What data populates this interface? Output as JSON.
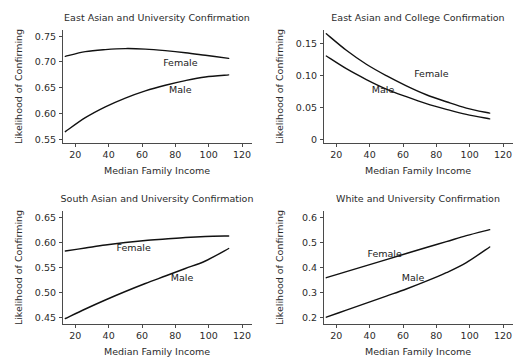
{
  "figure": {
    "width": 521,
    "height": 363,
    "background": "#ffffff",
    "line_color": "#111111",
    "axis_color": "#4a4a4a",
    "text_color": "#2b2b2b",
    "panel_layout": "2x2-grid"
  },
  "chart_data": [
    {
      "id": "east-asian-university",
      "position": "top-left",
      "type": "line",
      "title": "East Asian and University Confirmation",
      "xlabel": "Median Family Income",
      "ylabel": "Likelihood of Confirming",
      "xlim": [
        12,
        126
      ],
      "ylim": [
        0.543,
        0.762
      ],
      "xticks": [
        20,
        40,
        60,
        80,
        100,
        120
      ],
      "xticklabels": [
        "20",
        "40",
        "60",
        "80",
        "100",
        "120"
      ],
      "yticks": [
        0.55,
        0.6,
        0.65,
        0.7,
        0.75
      ],
      "yticklabels": [
        "0.55",
        "0.60",
        "0.65",
        "0.70",
        "0.75"
      ],
      "grid": false,
      "legend": "inline-labels",
      "x": [
        14,
        26,
        38,
        50,
        62,
        74,
        86,
        98,
        112
      ],
      "series": [
        {
          "name": "Female",
          "label": "Female",
          "label_x": 83,
          "label_y": 0.693,
          "values": [
            0.711,
            0.72,
            0.724,
            0.726,
            0.725,
            0.722,
            0.718,
            0.713,
            0.707
          ]
        },
        {
          "name": "Male",
          "label": "Male",
          "label_x": 83,
          "label_y": 0.639,
          "values": [
            0.565,
            0.592,
            0.613,
            0.63,
            0.644,
            0.655,
            0.664,
            0.671,
            0.675
          ]
        }
      ]
    },
    {
      "id": "east-asian-college",
      "position": "top-right",
      "type": "line",
      "title": "East Asian and College Confirmation",
      "xlabel": "Median Family Income",
      "ylabel": "Likelihood of Confirming",
      "xlim": [
        12,
        126
      ],
      "ylim": [
        -0.006,
        0.172
      ],
      "xticks": [
        20,
        40,
        60,
        80,
        100,
        120
      ],
      "xticklabels": [
        "20",
        "40",
        "60",
        "80",
        "100",
        "120"
      ],
      "yticks": [
        0,
        0.05,
        0.1,
        0.15
      ],
      "yticklabels": [
        "0",
        "0.05",
        "0.10",
        "0.15"
      ],
      "grid": false,
      "legend": "inline-labels",
      "x": [
        14,
        26,
        38,
        50,
        62,
        74,
        86,
        98,
        112
      ],
      "series": [
        {
          "name": "Female",
          "label": "Female",
          "label_x": 77,
          "label_y": 0.098,
          "values": [
            0.166,
            0.14,
            0.118,
            0.1,
            0.084,
            0.07,
            0.059,
            0.049,
            0.041
          ]
        },
        {
          "name": "Male",
          "label": "Male",
          "label_x": 48,
          "label_y": 0.073,
          "values": [
            0.131,
            0.111,
            0.094,
            0.079,
            0.067,
            0.056,
            0.047,
            0.039,
            0.032
          ]
        }
      ]
    },
    {
      "id": "south-asian-university",
      "position": "bottom-left",
      "type": "line",
      "title": "South Asian and University Confirmation",
      "xlabel": "Median Family Income",
      "ylabel": "Likelihood of Confirming",
      "xlim": [
        12,
        126
      ],
      "ylim": [
        0.437,
        0.663
      ],
      "xticks": [
        20,
        40,
        60,
        80,
        100,
        120
      ],
      "xticklabels": [
        "20",
        "40",
        "60",
        "80",
        "100",
        "120"
      ],
      "yticks": [
        0.45,
        0.5,
        0.55,
        0.6,
        0.65
      ],
      "yticklabels": [
        "0.45",
        "0.50",
        "0.55",
        "0.60",
        "0.65"
      ],
      "grid": false,
      "legend": "inline-labels",
      "x": [
        14,
        26,
        38,
        50,
        62,
        74,
        86,
        98,
        112
      ],
      "series": [
        {
          "name": "Female",
          "label": "Female",
          "label_x": 55,
          "label_y": 0.583,
          "values": [
            0.583,
            0.589,
            0.595,
            0.6,
            0.604,
            0.607,
            0.61,
            0.612,
            0.613
          ]
        },
        {
          "name": "Male",
          "label": "Male",
          "label_x": 84,
          "label_y": 0.523,
          "values": [
            0.448,
            0.467,
            0.485,
            0.502,
            0.518,
            0.533,
            0.548,
            0.563,
            0.588
          ]
        }
      ]
    },
    {
      "id": "white-university",
      "position": "bottom-right",
      "type": "line",
      "title": "White and University Confirmation",
      "xlabel": "Median Family Income",
      "ylabel": "Likelihood of Confirming",
      "xlim": [
        12,
        126
      ],
      "ylim": [
        0.176,
        0.625
      ],
      "xticks": [
        20,
        40,
        60,
        80,
        100,
        120
      ],
      "xticklabels": [
        "20",
        "40",
        "60",
        "80",
        "100",
        "120"
      ],
      "yticks": [
        0.2,
        0.3,
        0.4,
        0.5,
        0.6
      ],
      "yticklabels": [
        "0.2",
        "0.3",
        "0.4",
        "0.5",
        "0.6"
      ],
      "grid": false,
      "legend": "inline-labels",
      "x": [
        14,
        26,
        38,
        50,
        62,
        74,
        86,
        98,
        112
      ],
      "series": [
        {
          "name": "Female",
          "label": "Female",
          "label_x": 49,
          "label_y": 0.443,
          "values": [
            0.36,
            0.384,
            0.408,
            0.432,
            0.456,
            0.48,
            0.503,
            0.527,
            0.551
          ]
        },
        {
          "name": "Male",
          "label": "Male",
          "label_x": 66,
          "label_y": 0.347,
          "values": [
            0.203,
            0.231,
            0.259,
            0.287,
            0.315,
            0.346,
            0.38,
            0.42,
            0.482
          ]
        }
      ]
    }
  ]
}
